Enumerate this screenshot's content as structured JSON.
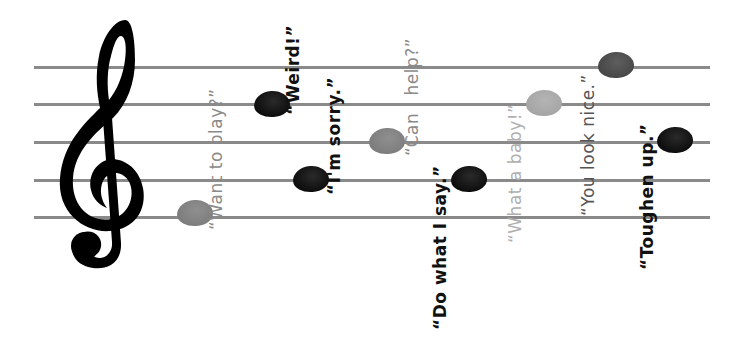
{
  "diagram": {
    "type": "musical-staff-illustration",
    "staff": {
      "line_count": 5,
      "line_y": [
        67,
        104,
        142,
        180,
        217
      ],
      "line_x_start": 34,
      "line_x_end": 710,
      "line_color": "#8a8a8a"
    },
    "clef": {
      "icon": "treble-clef-icon",
      "color": "#000000"
    },
    "notes": [
      {
        "id": "want-to-play",
        "text": "“Want to play?”",
        "shade": "gray",
        "color": "#8a8a8a",
        "note_x": 177,
        "note_y": 200,
        "text_x": 206,
        "text_y": 230
      },
      {
        "id": "weird",
        "text": "“Weird!”",
        "shade": "black",
        "color": "#111111",
        "note_x": 254,
        "note_y": 91,
        "text_x": 283,
        "text_y": 115
      },
      {
        "id": "im-sorry",
        "text": "“I'm sorry.”",
        "shade": "black",
        "color": "#111111",
        "note_x": 293,
        "note_y": 166,
        "text_x": 326,
        "text_y": 193
      },
      {
        "id": "can-i-help",
        "text": "“Can I help?”",
        "shade": "gray",
        "color": "#8a8a8a",
        "note_x": 369,
        "note_y": 128,
        "text_x": 404,
        "text_y": 155
      },
      {
        "id": "do-what-i-say",
        "text": "“Do what I say.”",
        "shade": "black",
        "color": "#111111",
        "note_x": 451,
        "note_y": 166,
        "text_x": 430,
        "text_y": 330
      },
      {
        "id": "what-a-baby",
        "text": "“What a baby!”",
        "shade": "light",
        "color": "#b0b0b0",
        "note_x": 526,
        "note_y": 90,
        "text_x": 505,
        "text_y": 243
      },
      {
        "id": "you-look-nice",
        "text": "“You look nice.”",
        "shade": "dark",
        "color": "#555555",
        "note_x": 598,
        "note_y": 52,
        "text_x": 578,
        "text_y": 216
      },
      {
        "id": "toughen-up",
        "text": "“Toughen up.”",
        "shade": "black",
        "color": "#111111",
        "note_x": 657,
        "note_y": 127,
        "text_x": 637,
        "text_y": 270
      }
    ]
  }
}
